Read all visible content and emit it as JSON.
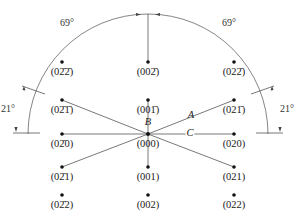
{
  "figure": {
    "type": "electron diffraction pattern with stereographic angle arc",
    "center_label": "(000)",
    "vector_labels": {
      "A": "A",
      "B": "B",
      "C": "C"
    },
    "angles": {
      "top_left": "69°",
      "top_right": "69°",
      "left": "21°",
      "right": "21°"
    },
    "spots": [
      {
        "id": "s-0m2m2",
        "hkl": "(02̄2̄)",
        "x": 62,
        "y": 62
      },
      {
        "id": "s-00m2",
        "hkl": "(002̄)",
        "x": 148,
        "y": 62
      },
      {
        "id": "s-02m2",
        "hkl": "(022̄)",
        "x": 234,
        "y": 62
      },
      {
        "id": "s-0m2m1",
        "hkl": "(02̄1̄)",
        "x": 62,
        "y": 100
      },
      {
        "id": "s-00m1",
        "hkl": "(001̄)",
        "x": 148,
        "y": 100
      },
      {
        "id": "s-02m1",
        "hkl": "(021̄)",
        "x": 234,
        "y": 100
      },
      {
        "id": "s-0m20",
        "hkl": "(02̄0)",
        "x": 62,
        "y": 134
      },
      {
        "id": "s-000",
        "hkl": "(000)",
        "x": 148,
        "y": 134
      },
      {
        "id": "s-020",
        "hkl": "(020)",
        "x": 234,
        "y": 134
      },
      {
        "id": "s-0m21",
        "hkl": "(02̄1)",
        "x": 62,
        "y": 167
      },
      {
        "id": "s-001",
        "hkl": "(001)",
        "x": 148,
        "y": 167
      },
      {
        "id": "s-021",
        "hkl": "(021)",
        "x": 234,
        "y": 167
      },
      {
        "id": "s-0m22",
        "hkl": "(02̄2)",
        "x": 62,
        "y": 195
      },
      {
        "id": "s-002",
        "hkl": "(002)",
        "x": 148,
        "y": 195
      },
      {
        "id": "s-022",
        "hkl": "(022)",
        "x": 234,
        "y": 195
      }
    ],
    "line_color": "#444444",
    "spot_color": "#111111"
  }
}
